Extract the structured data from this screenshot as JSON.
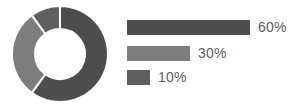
{
  "chart_data": {
    "type": "pie",
    "title": "",
    "subtitle": "",
    "xlabel": "",
    "ylabel": "",
    "variant": "donut",
    "legend_position": "right",
    "grid": false,
    "categories": [
      "Segment 1",
      "Segment 2",
      "Segment 3"
    ],
    "values": [
      60,
      30,
      10
    ],
    "labels": [
      "60%",
      "30%",
      "10%"
    ],
    "colors": [
      "#4d4d4d",
      "#7d7d7d",
      "#5f5f5f"
    ],
    "units": "percent",
    "total": 100,
    "donut": {
      "start_angle_deg": 0,
      "direction": "clockwise",
      "inner_radius_ratio": 0.52,
      "separator_color": "#ffffff",
      "separator_width_px": 2,
      "center_x": 52,
      "center_y": 50,
      "outer_radius": 48,
      "inner_radius": 25
    },
    "legend_bars": {
      "max_width_px": 123,
      "bar_height_px": 15,
      "row_gap_px": 10
    }
  },
  "donut_segments": [
    {
      "name": "segment-60",
      "value": 60,
      "color": "#4d4d4d",
      "label": "60%"
    },
    {
      "name": "segment-30",
      "value": 30,
      "color": "#7d7d7d",
      "label": "30%"
    },
    {
      "name": "segment-10",
      "value": 10,
      "color": "#5f5f5f",
      "label": "10%"
    }
  ],
  "legend": {
    "rows": [
      {
        "label": "60%",
        "value": 60,
        "color": "#4d4d4d",
        "bar_width_px": 123
      },
      {
        "label": "30%",
        "value": 30,
        "color": "#7d7d7d",
        "bar_width_px": 63
      },
      {
        "label": "10%",
        "value": 10,
        "color": "#5f5f5f",
        "bar_width_px": 23
      }
    ]
  },
  "theme": {
    "background": "#ffffff",
    "text_color": "#5c5c5c",
    "accent_dark": "#4d4d4d",
    "accent_mid": "#7d7d7d",
    "accent_light": "#5f5f5f"
  }
}
